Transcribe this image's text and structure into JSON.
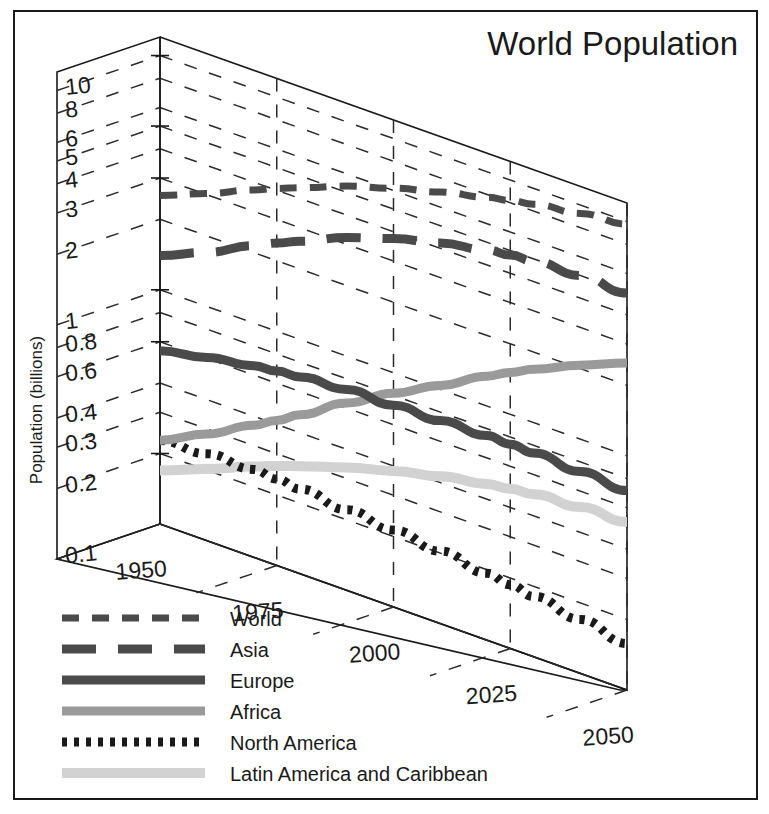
{
  "chart_data": {
    "type": "line",
    "projection": "3d-isometric",
    "title": "World Population",
    "xlabel": "",
    "ylabel": "Population (billions)",
    "yscale": "log",
    "ylim": [
      0.1,
      12
    ],
    "grid": true,
    "legend_position": "bottom-left",
    "y_ticks": [
      "10",
      "8",
      "6",
      "5",
      "4",
      "3",
      "2",
      "1",
      "0.8",
      "0.6",
      "0.4",
      "0.3",
      "0.2",
      "0.1"
    ],
    "y_tick_values": [
      10,
      8,
      6,
      5,
      4,
      3,
      2,
      1,
      0.8,
      0.6,
      0.4,
      0.3,
      0.2,
      0.1
    ],
    "x_ticks": [
      "1950",
      "1975",
      "2000",
      "2025",
      "2050"
    ],
    "x_tick_values": [
      1950,
      1975,
      2000,
      2025,
      2050
    ],
    "x": [
      1950,
      1960,
      1970,
      1975,
      1980,
      1990,
      2000,
      2010,
      2020,
      2025,
      2030,
      2040,
      2050
    ],
    "series": [
      {
        "name": "World",
        "style": "dashed",
        "color": "#4a4a4a",
        "width": 7,
        "dasharray": "17 13",
        "values": [
          2.53,
          3.03,
          3.7,
          4.07,
          4.45,
          5.32,
          6.14,
          6.96,
          7.79,
          8.18,
          8.55,
          9.2,
          9.74
        ]
      },
      {
        "name": "Asia",
        "style": "long-dash",
        "color": "#4a4a4a",
        "width": 9,
        "dasharray": "34 22",
        "values": [
          1.4,
          1.7,
          2.14,
          2.38,
          2.63,
          3.21,
          3.74,
          4.21,
          4.64,
          4.78,
          4.89,
          5.0,
          4.95
        ]
      },
      {
        "name": "Europe",
        "style": "solid",
        "color": "#4a4a4a",
        "width": 9,
        "dasharray": "none",
        "values": [
          0.549,
          0.605,
          0.657,
          0.676,
          0.693,
          0.721,
          0.727,
          0.736,
          0.747,
          0.745,
          0.741,
          0.727,
          0.71
        ]
      },
      {
        "name": "Africa",
        "style": "solid",
        "color": "#9a9a9a",
        "width": 9,
        "dasharray": "none",
        "values": [
          0.228,
          0.285,
          0.366,
          0.416,
          0.478,
          0.632,
          0.818,
          1.04,
          1.34,
          1.51,
          1.69,
          2.07,
          2.49
        ]
      },
      {
        "name": "North America",
        "style": "dotted",
        "color": "#1a1a1a",
        "width": 9,
        "dasharray": "5 7",
        "values": [
          0.227,
          0.235,
          0.237,
          0.234,
          0.23,
          0.221,
          0.213,
          0.204,
          0.193,
          0.187,
          0.181,
          0.17,
          0.158
        ]
      },
      {
        "name": "Latin America and Caribbean",
        "style": "solid",
        "color": "#d2d2d2",
        "width": 10,
        "dasharray": "none",
        "values": [
          0.169,
          0.202,
          0.244,
          0.266,
          0.288,
          0.335,
          0.381,
          0.426,
          0.465,
          0.481,
          0.494,
          0.513,
          0.522
        ]
      }
    ]
  },
  "legend": {
    "items": [
      {
        "label": "World"
      },
      {
        "label": "Asia"
      },
      {
        "label": "Europe"
      },
      {
        "label": "Africa"
      },
      {
        "label": "North America"
      },
      {
        "label": "Latin America and Caribbean"
      }
    ]
  }
}
